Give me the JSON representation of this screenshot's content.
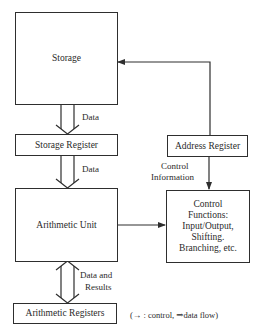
{
  "diagram": {
    "nodes": {
      "storage": "Storage",
      "storage_register": "Storage Register",
      "arithmetic_unit": "Arithmetic Unit",
      "arithmetic_registers": "Arithmetic Registers",
      "address_register": "Address Register",
      "control_functions": {
        "line1": "Control",
        "line2": "Functions:",
        "line3": "Input/Output,",
        "line4": "Shifting.",
        "line5": "Branching, etc."
      }
    },
    "edge_labels": {
      "storage_to_register": "Data",
      "register_to_arithmetic": "Data",
      "arithmetic_registers_line1": "Data and",
      "arithmetic_registers_line2": "Results",
      "control_info_line1": "Control",
      "control_info_line2": "Information"
    },
    "legend": "(→ : control, ⇒data flow)",
    "colors": {
      "line": "#2e2e2e",
      "background": "#ffffff"
    }
  }
}
